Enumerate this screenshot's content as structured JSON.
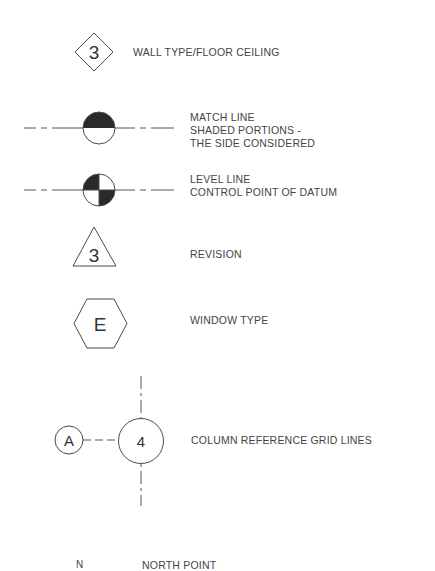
{
  "legend": {
    "wall_type": {
      "symbol_text": "3",
      "label": "WALL TYPE/FLOOR CEILING"
    },
    "match_line": {
      "label_lines": [
        "MATCH LINE",
        "SHADED PORTIONS -",
        "THE SIDE CONSIDERED"
      ]
    },
    "level_line": {
      "label_lines": [
        "LEVEL LINE",
        "CONTROL POINT OF DATUM"
      ]
    },
    "revision": {
      "symbol_text": "3",
      "label": "REVISION"
    },
    "window_type": {
      "symbol_text": "E",
      "label": "WINDOW TYPE"
    },
    "column_grid": {
      "row_symbol_text": "A",
      "column_symbol_text": "4",
      "label": "COLUMN REFERENCE GRID LINES"
    },
    "north_point": {
      "symbol_text": "N",
      "label": "NORTH POINT"
    }
  },
  "colors": {
    "line": "#4a4a4a",
    "fill": "#2a2a2a",
    "text": "#444444"
  }
}
